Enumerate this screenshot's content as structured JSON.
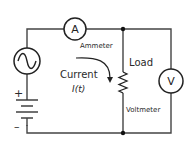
{
  "diagram": {
    "type": "electrical-circuit",
    "components": {
      "ac_source": {
        "symbol": "sine-wave"
      },
      "battery": {
        "plus_label": "+",
        "minus_label": "–"
      },
      "ammeter": {
        "letter": "A",
        "label": "Ammeter"
      },
      "load": {
        "label": "Load",
        "symbol": "resistor"
      },
      "voltmeter": {
        "letter": "V",
        "label": "Voltmeter"
      }
    },
    "current": {
      "label": "Current",
      "symbol": "I(t)"
    },
    "colors": {
      "wire": "#444444",
      "text": "#2a2a2a",
      "background": "#ffffff"
    }
  }
}
